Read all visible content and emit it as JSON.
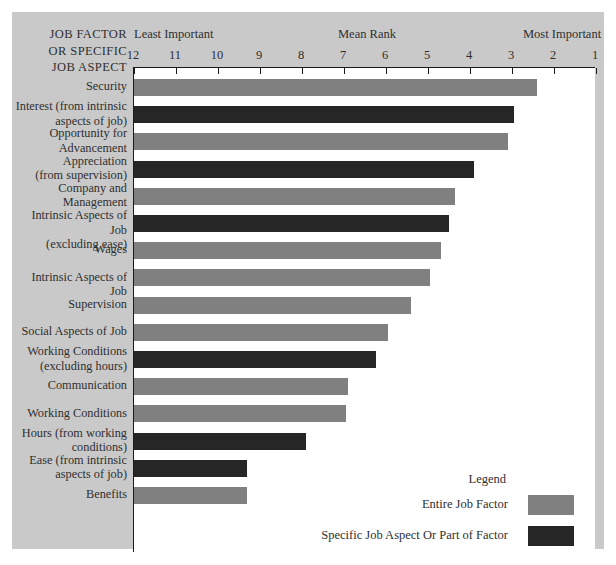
{
  "header": {
    "row_axis_title_lines": [
      "JOB FACTOR",
      "OR SPECIFIC",
      "JOB ASPECT"
    ],
    "least_important": "Least Important",
    "mean_rank": "Mean Rank",
    "most_important": "Most Important"
  },
  "legend": {
    "title": "Legend",
    "entries": [
      {
        "label": "Entire Job Factor",
        "color": "#808080",
        "key": "factor"
      },
      {
        "label": "Specific Job Aspect Or Part of Factor",
        "color": "#262626",
        "key": "specific"
      }
    ]
  },
  "chart_data": {
    "type": "bar",
    "orientation": "horizontal",
    "title": "",
    "xlabel": "Mean Rank",
    "ylabel": "JOB FACTOR OR SPECIFIC JOB ASPECT",
    "xlim": [
      12,
      1
    ],
    "x_axis_reversed": true,
    "x_axis_position": "top",
    "tick_labels": [
      "12",
      "11",
      "10",
      "9",
      "8",
      "7",
      "6",
      "5",
      "4",
      "3",
      "2",
      "1"
    ],
    "tick_values": [
      12,
      11,
      10,
      9,
      8,
      7,
      6,
      5,
      4,
      3,
      2,
      1
    ],
    "grid": false,
    "legend_position": "bottom-right",
    "bar_baseline": 12,
    "categories": [
      "Security",
      "Interest (from intrinsic aspects of job)",
      "Opportunity for Advancement",
      "Appreciation (from supervision)",
      "Company and Management",
      "Intrinsic Aspects of Job (excluding ease)",
      "Wages",
      "Intrinsic Aspects of Job",
      "Supervision",
      "Social Aspects of Job",
      "Working Conditions (excluding hours)",
      "Communication",
      "Working Conditions",
      "Hours (from working conditions)",
      "Ease (from intrinsic aspects of job)",
      "Benefits"
    ],
    "category_label_lines": [
      [
        "Security"
      ],
      [
        "Interest (from intrinsic",
        "aspects of job)"
      ],
      [
        "Opportunity for",
        "Advancement"
      ],
      [
        "Appreciation",
        "(from supervision)"
      ],
      [
        "Company and",
        "Management"
      ],
      [
        "Intrinsic Aspects of Job",
        "(excluding ease)"
      ],
      [
        "Wages"
      ],
      [
        "Intrinsic Aspects of Job"
      ],
      [
        "Supervision"
      ],
      [
        "Social Aspects of Job"
      ],
      [
        "Working Conditions",
        "(excluding hours)"
      ],
      [
        "Communication"
      ],
      [
        "Working Conditions"
      ],
      [
        "Hours (from working",
        "conditions)"
      ],
      [
        "Ease (from intrinsic",
        "aspects of job)"
      ],
      [
        "Benefits"
      ]
    ],
    "values": [
      2.4,
      2.95,
      3.1,
      3.9,
      4.35,
      4.5,
      4.7,
      4.95,
      5.4,
      5.95,
      6.25,
      6.9,
      6.95,
      7.9,
      9.3,
      9.3
    ],
    "series_of_bar": [
      "factor",
      "specific",
      "factor",
      "specific",
      "factor",
      "specific",
      "factor",
      "factor",
      "factor",
      "factor",
      "specific",
      "factor",
      "factor",
      "specific",
      "specific",
      "factor"
    ],
    "colors": {
      "factor": "#808080",
      "specific": "#262626"
    },
    "background": "#c9c9c9",
    "plot_background": "#ffffff"
  }
}
